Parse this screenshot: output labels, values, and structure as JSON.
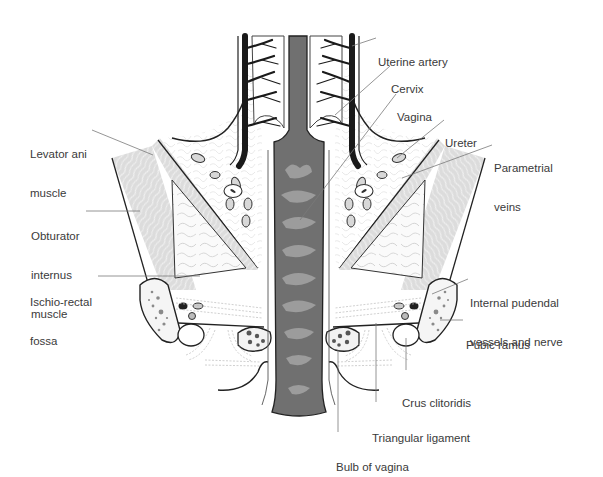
{
  "figure": {
    "colors": {
      "background": "#ffffff",
      "vagina_fill": "#6f6f6f",
      "rugae_fill": "#9a9a9a",
      "muscle_fill": "#dedede",
      "outline": "#222222",
      "artery": "#1a1a1a",
      "leader_line": "#7a7a7a",
      "label_text": "#3a3a3a"
    }
  },
  "labels": {
    "uterine_artery": "Uterine artery",
    "cervix": "Cervix",
    "vagina": "Vagina",
    "ureter": "Ureter",
    "parametrial_veins": {
      "line1": "Parametrial",
      "line2": "veins"
    },
    "levator_ani": {
      "line1": "Levator ani",
      "line2": "muscle"
    },
    "obturator_internus": {
      "line1": "Obturator",
      "line2": "internus",
      "line3": "muscle"
    },
    "ischio_rectal": {
      "line1": "Ischio-rectal",
      "line2": "fossa"
    },
    "internal_pudendal": {
      "line1": "Internal pudendal",
      "line2": "vessels and nerve"
    },
    "pubic_ramus": "Pubic ramus",
    "crus_clitoridis": "Crus clitoridis",
    "triangular_ligament": "Triangular ligament",
    "bulb_of_vagina": "Bulb of vagina"
  }
}
